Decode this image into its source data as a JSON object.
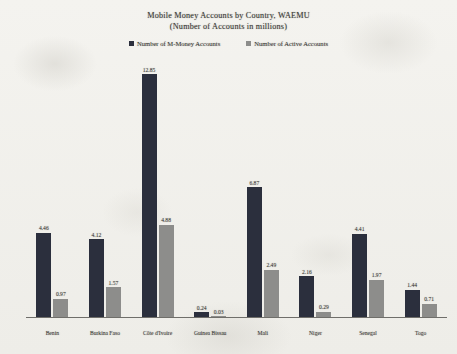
{
  "chart_data": {
    "type": "bar",
    "title": "Mobile Money Accounts by Country, WAEMU",
    "subtitle": "(Number of Accounts in millions)",
    "xlabel": "",
    "ylabel": "",
    "ylim": [
      0,
      13.5
    ],
    "grid": false,
    "legend_position": "top-center",
    "categories": [
      "Benin",
      "Burkina Faso",
      "Côte d'Ivoire",
      "Guinea Bissau",
      "Mali",
      "Niger",
      "Senegal",
      "Togo"
    ],
    "series": [
      {
        "name": "Number of M-Money Accounts",
        "color": "#2b2f3d",
        "values": [
          4.46,
          4.12,
          12.85,
          0.24,
          6.87,
          2.16,
          4.41,
          1.44
        ],
        "labels": [
          "4.46",
          "4.12",
          "12.85",
          "0.24",
          "6.87",
          "2.16",
          "4.41",
          "1.44"
        ]
      },
      {
        "name": "Number of Active Accounts",
        "color": "#8d8d8b",
        "values": [
          0.97,
          1.57,
          4.88,
          0.03,
          2.49,
          0.29,
          1.97,
          0.71
        ],
        "labels": [
          "0.97",
          "1.57",
          "4.88",
          "0.03",
          "2.49",
          "0.29",
          "1.97",
          "0.71"
        ]
      }
    ]
  }
}
